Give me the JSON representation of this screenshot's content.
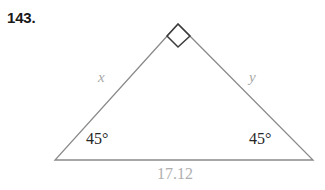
{
  "problem": {
    "number": "143."
  },
  "figure": {
    "type": "right-isosceles-triangle",
    "stroke_color": "#8a8a8a",
    "right_angle_mark_color": "#3c3c3c",
    "vertices": {
      "apex": [
        178,
        24
      ],
      "left": [
        55,
        160
      ],
      "right": [
        313,
        160
      ]
    },
    "labels": {
      "left_leg": "x",
      "right_leg": "y",
      "left_angle": "45°",
      "right_angle": "45°",
      "base": "17.12"
    },
    "label_colors": {
      "side": "#a8a8a8",
      "angle": "#262626",
      "base": "#b0b0b0"
    }
  }
}
